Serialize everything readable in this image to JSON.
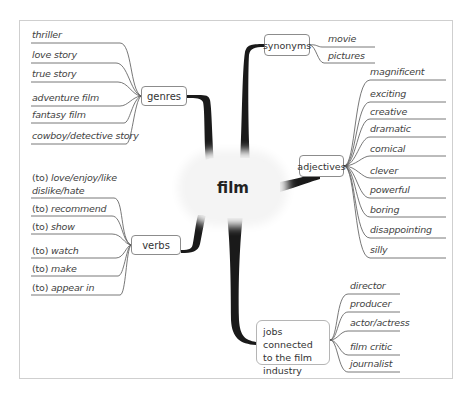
{
  "center": {
    "label": "film"
  },
  "branches": {
    "genres": {
      "label": "genres",
      "items": [
        "thriller",
        "love story",
        "true story",
        "adventure film",
        "fantasy film",
        "cowboy/detective story"
      ]
    },
    "verbs": {
      "label": "verbs",
      "items": [
        {
          "prefix": "(to)",
          "text": "love/enjoy/like",
          "line2": "dislike/hate"
        },
        {
          "prefix": "(to)",
          "text": "recommend"
        },
        {
          "prefix": "(to)",
          "text": "show"
        },
        {
          "prefix": "(to)",
          "text": "watch"
        },
        {
          "prefix": "(to)",
          "text": "make"
        },
        {
          "prefix": "(to)",
          "text": "appear in"
        }
      ]
    },
    "synonyms": {
      "label": "synonyms",
      "items": [
        "movie",
        "pictures"
      ]
    },
    "adjectives": {
      "label": "adjectives",
      "items": [
        "magnificent",
        "exciting",
        "creative",
        "dramatic",
        "comical",
        "clever",
        "powerful",
        "boring",
        "disappointing",
        "silly"
      ]
    },
    "jobs": {
      "label_lines": [
        "jobs connected",
        "to the film",
        "industry"
      ],
      "items": [
        "director",
        "producer",
        "actor/actress",
        "film critic",
        "journalist"
      ]
    }
  },
  "colors": {
    "trunk": "#1a1a1a",
    "line": "#555555",
    "frame": "#cfcfcf",
    "center_bg": "#f4f4f4"
  }
}
